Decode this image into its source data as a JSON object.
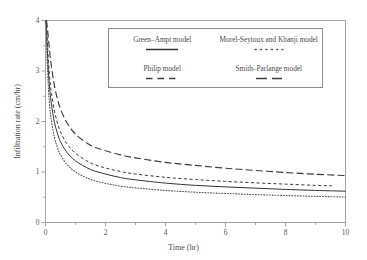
{
  "chart_data": {
    "type": "line",
    "title": "",
    "xlabel": "Time (hr)",
    "ylabel": "Infiltration rate (cm/hr)",
    "xlim": [
      0,
      10
    ],
    "ylim": [
      0,
      4
    ],
    "xticks": [
      "0",
      "2",
      "4",
      "6",
      "8",
      "10"
    ],
    "yticks": [
      "0",
      "1",
      "2",
      "3",
      "4"
    ],
    "xtick_values": [
      0,
      2,
      4,
      6,
      8,
      10
    ],
    "ytick_values": [
      0,
      1,
      2,
      3,
      4
    ],
    "grid": false,
    "legend_position": "upper center inside",
    "x": [
      0.02,
      0.05,
      0.1,
      0.15,
      0.2,
      0.3,
      0.4,
      0.5,
      0.7,
      1.0,
      1.5,
      2.0,
      2.5,
      3.0,
      4.0,
      5.0,
      6.0,
      7.0,
      8.0,
      9.0,
      10.0
    ],
    "series": [
      {
        "name": "Green-Ampt model",
        "label": "Green–Ampt model",
        "style": "solid",
        "color": "#333333",
        "values": [
          4.0,
          3.55,
          2.95,
          2.58,
          2.33,
          1.98,
          1.76,
          1.6,
          1.4,
          1.22,
          1.05,
          0.96,
          0.89,
          0.845,
          0.78,
          0.735,
          0.705,
          0.68,
          0.655,
          0.635,
          0.62
        ]
      },
      {
        "name": "Morel-Seytoux and Khanji model",
        "label": "Morel-Seytoux and Khanji model",
        "style": "dotted",
        "color": "#555555",
        "values": [
          4.0,
          3.3,
          2.62,
          2.24,
          2.0,
          1.68,
          1.48,
          1.34,
          1.16,
          1.0,
          0.855,
          0.775,
          0.72,
          0.685,
          0.635,
          0.6,
          0.575,
          0.552,
          0.535,
          0.518,
          0.505
        ]
      },
      {
        "name": "Philip model",
        "label": "Philip model",
        "style": "dashed-short",
        "color": "#3c3c3c",
        "values": [
          4.0,
          3.72,
          3.18,
          2.8,
          2.55,
          2.2,
          1.97,
          1.8,
          1.57,
          1.37,
          1.18,
          1.08,
          1.01,
          0.96,
          0.895,
          0.85,
          0.815,
          0.785,
          0.76,
          0.735,
          0.72
        ]
      },
      {
        "name": "Smith-Parlange model",
        "label": "Smith–Parlange model",
        "style": "dashed-long",
        "color": "#3c3c3c",
        "values": [
          4.0,
          3.93,
          3.62,
          3.32,
          3.08,
          2.7,
          2.44,
          2.25,
          1.99,
          1.75,
          1.53,
          1.42,
          1.34,
          1.28,
          1.19,
          1.13,
          1.075,
          1.03,
          0.99,
          0.955,
          0.93
        ]
      }
    ]
  },
  "axes": {
    "x_title": "Time (hr)",
    "y_title": "Infiltration rate (cm/hr)"
  },
  "legend": {
    "entries": [
      {
        "label": "Green–Ampt model",
        "style": "solid"
      },
      {
        "label": "Morel-Seytoux and Khanji model",
        "style": "dotted"
      },
      {
        "label": "Philip model",
        "style": "dashed-short"
      },
      {
        "label": "Smith–Parlange model",
        "style": "dashed-long"
      }
    ]
  },
  "colors": {
    "axis": "#8d8d8d",
    "text": "#4a4a4a",
    "curve_solid": "#333333",
    "curve_dotted": "#555555",
    "curve_dashed": "#3c3c3c",
    "background": "#ffffff"
  }
}
